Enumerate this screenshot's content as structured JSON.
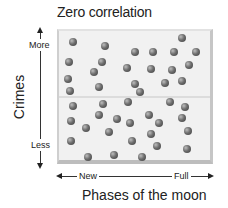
{
  "title": "Zero correlation",
  "chart_data": {
    "type": "scatter",
    "title": "Zero correlation",
    "xlabel": "Phases of the moon",
    "ylabel": "Crimes",
    "x_tick_labels": [
      "New",
      "Full"
    ],
    "y_tick_labels": [
      "Less",
      "More"
    ],
    "grid": false,
    "note": "Points plotted in pixel coordinates within plot area (x: 0=New side to 100=Full side, y: 0=Less to 100=More)",
    "points": [
      {
        "x": 10,
        "y": 91
      },
      {
        "x": 30,
        "y": 88
      },
      {
        "x": 79,
        "y": 94
      },
      {
        "x": 49,
        "y": 83
      },
      {
        "x": 61,
        "y": 83
      },
      {
        "x": 74,
        "y": 83
      },
      {
        "x": 88,
        "y": 83
      },
      {
        "x": 7,
        "y": 76
      },
      {
        "x": 28,
        "y": 76
      },
      {
        "x": 23,
        "y": 69
      },
      {
        "x": 44,
        "y": 72
      },
      {
        "x": 59,
        "y": 71
      },
      {
        "x": 72,
        "y": 70
      },
      {
        "x": 83,
        "y": 74
      },
      {
        "x": 7,
        "y": 64
      },
      {
        "x": 27,
        "y": 58
      },
      {
        "x": 49,
        "y": 60
      },
      {
        "x": 53,
        "y": 54
      },
      {
        "x": 69,
        "y": 61
      },
      {
        "x": 80,
        "y": 62
      },
      {
        "x": 8,
        "y": 55
      },
      {
        "x": 10,
        "y": 43
      },
      {
        "x": 29,
        "y": 44
      },
      {
        "x": 45,
        "y": 46
      },
      {
        "x": 72,
        "y": 46
      },
      {
        "x": 81,
        "y": 42
      },
      {
        "x": 9,
        "y": 32
      },
      {
        "x": 27,
        "y": 36
      },
      {
        "x": 39,
        "y": 33
      },
      {
        "x": 47,
        "y": 31
      },
      {
        "x": 59,
        "y": 36
      },
      {
        "x": 65,
        "y": 31
      },
      {
        "x": 80,
        "y": 34
      },
      {
        "x": 19,
        "y": 27
      },
      {
        "x": 33,
        "y": 24
      },
      {
        "x": 60,
        "y": 23
      },
      {
        "x": 84,
        "y": 25
      },
      {
        "x": 9,
        "y": 18
      },
      {
        "x": 48,
        "y": 18
      },
      {
        "x": 64,
        "y": 14
      },
      {
        "x": 83,
        "y": 12
      },
      {
        "x": 20,
        "y": 6
      },
      {
        "x": 37,
        "y": 7
      },
      {
        "x": 55,
        "y": 6
      }
    ],
    "dot_pixels": [
      [
        73,
        42
      ],
      [
        105,
        46
      ],
      [
        182,
        38
      ],
      [
        135,
        52
      ],
      [
        153,
        52
      ],
      [
        174,
        52
      ],
      [
        196,
        52
      ],
      [
        69,
        62
      ],
      [
        102,
        62
      ],
      [
        94,
        72
      ],
      [
        127,
        68
      ],
      [
        151,
        69
      ],
      [
        172,
        70
      ],
      [
        189,
        65
      ],
      [
        68,
        79
      ],
      [
        99,
        87
      ],
      [
        135,
        84
      ],
      [
        140,
        92
      ],
      [
        165,
        83
      ],
      [
        182,
        81
      ],
      [
        70,
        91
      ],
      [
        73,
        106
      ],
      [
        103,
        104
      ],
      [
        128,
        102
      ],
      [
        170,
        102
      ],
      [
        185,
        107
      ],
      [
        71,
        121
      ],
      [
        99,
        115
      ],
      [
        117,
        119
      ],
      [
        130,
        123
      ],
      [
        149,
        115
      ],
      [
        159,
        123
      ],
      [
        182,
        118
      ],
      [
        86,
        128
      ],
      [
        109,
        132
      ],
      [
        151,
        134
      ],
      [
        188,
        131
      ],
      [
        71,
        141
      ],
      [
        132,
        141
      ],
      [
        157,
        146
      ],
      [
        187,
        149
      ],
      [
        88,
        157
      ],
      [
        114,
        155
      ],
      [
        142,
        157
      ]
    ]
  },
  "axes": {
    "y": {
      "title": "Crimes",
      "top_label": "More",
      "bottom_label": "Less"
    },
    "x": {
      "title": "Phases of the moon",
      "left_label": "New",
      "right_label": "Full"
    }
  }
}
